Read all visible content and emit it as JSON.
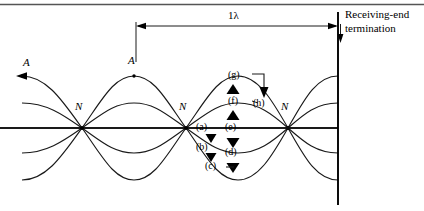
{
  "figure": {
    "kind": "standing-wave-on-transmission-line",
    "top_rule": {
      "present": true
    },
    "dimension": {
      "label": "1λ",
      "start_x": 136,
      "end_x": 338
    },
    "termination": {
      "label_line_1": "Receiving-end",
      "label_line_2": "termination",
      "x": 338
    },
    "antinode_labels": [
      {
        "text": "A",
        "x": 26,
        "y": 64
      },
      {
        "text": "A",
        "x": 131,
        "y": 62
      }
    ],
    "node_labels": [
      {
        "text": "N",
        "x": 79,
        "y": 108
      },
      {
        "text": "N",
        "x": 183,
        "y": 108
      },
      {
        "text": "N",
        "x": 285,
        "y": 108
      }
    ],
    "phase_labels": [
      {
        "text": "(a)",
        "x": 210,
        "y": 128
      },
      {
        "text": "(b)",
        "x": 210,
        "y": 148
      },
      {
        "text": "(c)",
        "x": 210,
        "y": 167
      },
      {
        "text": "(d)",
        "x": 238,
        "y": 153
      },
      {
        "text": "(e)",
        "x": 238,
        "y": 128
      },
      {
        "text": "(f)",
        "x": 238,
        "y": 102
      },
      {
        "text": "(g)",
        "x": 238,
        "y": 76
      },
      {
        "text": "(h)",
        "x": 262,
        "y": 104
      }
    ],
    "baseline_y": 128,
    "nodes_x": [
      82,
      186,
      288
    ],
    "amplitudes": [
      52,
      25
    ]
  },
  "colors": {
    "ink": "#000000",
    "rule": "#555555",
    "background": "#ffffff"
  }
}
